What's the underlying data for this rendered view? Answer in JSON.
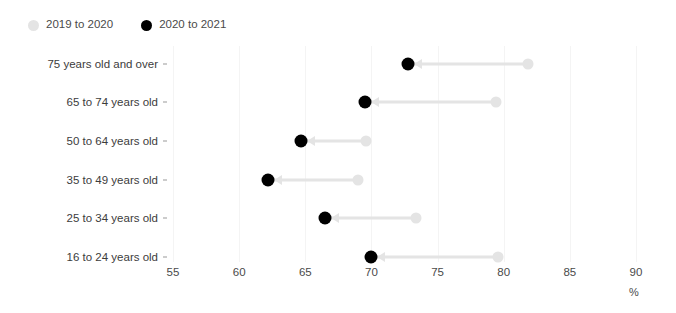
{
  "chart_data": {
    "type": "scatter",
    "title": "",
    "subtitle": "",
    "xlabel": "%",
    "ylabel": "",
    "xlim": [
      55,
      90
    ],
    "xticks": [
      55,
      60,
      65,
      70,
      75,
      80,
      85,
      90
    ],
    "xtick_labels": [
      "55",
      "60",
      "65",
      "70",
      "75",
      "80",
      "85",
      "90"
    ],
    "grid": true,
    "legend_position": "top-left",
    "categories": [
      "75 years old and over",
      "65 to 74 years old",
      "50 to 64 years old",
      "35 to 49 years old",
      "25 to 34 years old",
      "16 to 24 years old"
    ],
    "series": [
      {
        "name": "2019 to 2020",
        "color": "#e4e4e4",
        "marker": "circle",
        "values": [
          81.8,
          79.4,
          69.6,
          69.0,
          73.4,
          79.6
        ]
      },
      {
        "name": "2020 to 2021",
        "color": "#000000",
        "marker": "circle",
        "values": [
          72.8,
          69.5,
          64.7,
          62.2,
          66.5,
          70.0
        ]
      }
    ],
    "annotations": [
      "Arrows point from the 2019 to 2020 value to the 2020 to 2021 value for each age band."
    ]
  },
  "legend": {
    "items": [
      {
        "label": "2019 to 2020",
        "color": "#e4e4e4"
      },
      {
        "label": "2020 to 2021",
        "color": "#000000"
      }
    ]
  },
  "axis": {
    "unit_label": "%"
  }
}
